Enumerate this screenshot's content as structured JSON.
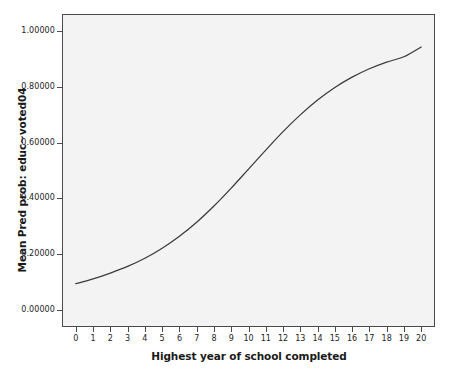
{
  "chart_data": {
    "type": "line",
    "title": "",
    "subtitle": "",
    "xlabel": "Highest year of school completed",
    "ylabel": "Mean Pred prob: educ~voted04",
    "xlim": [
      -0.8,
      20.8
    ],
    "ylim": [
      -0.06,
      1.06
    ],
    "grid": false,
    "legend": false,
    "legend_position": "none",
    "x_tick_labels": [
      "0",
      "1",
      "2",
      "3",
      "4",
      "5",
      "6",
      "7",
      "8",
      "9",
      "10",
      "11",
      "12",
      "13",
      "14",
      "15",
      "16",
      "17",
      "18",
      "19",
      "20"
    ],
    "y_tick_labels": [
      "1.00000",
      "0.80000",
      "0.60000",
      "0.40000",
      "0.20000",
      "0.00000"
    ],
    "y_tick_values": [
      1.0,
      0.8,
      0.6,
      0.4,
      0.2,
      0.0
    ],
    "x": [
      0,
      1,
      2,
      3,
      4,
      5,
      6,
      7,
      8,
      9,
      10,
      11,
      12,
      13,
      14,
      15,
      16,
      17,
      18,
      19,
      20
    ],
    "series": [
      {
        "name": "Mean Pred prob: educ~voted04",
        "color": "#3b3b3b",
        "values": [
          0.095,
          0.112,
          0.133,
          0.157,
          0.186,
          0.222,
          0.265,
          0.315,
          0.373,
          0.437,
          0.505,
          0.573,
          0.639,
          0.699,
          0.752,
          0.797,
          0.834,
          0.864,
          0.888,
          0.907,
          0.942
        ]
      }
    ]
  },
  "axes": {
    "y_title": "Mean Pred prob: educ~voted04",
    "x_title": "Highest year of school completed"
  },
  "style": {
    "plot_background": "#f3f3f3",
    "page_background": "#ffffff",
    "frame_color": "#4a4a4a",
    "line_color": "#3b3b3b",
    "tick_text_color": "#242424",
    "title_text_color": "#1a1a1a"
  }
}
